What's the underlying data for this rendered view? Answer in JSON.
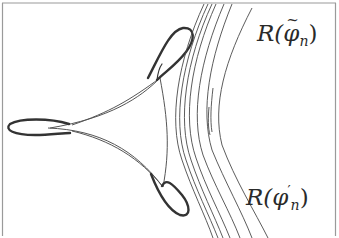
{
  "figure": {
    "colors": {
      "background": "#ffffff",
      "frame": "#9a9a9a",
      "thin_curve": "#555555",
      "thick_lobe": "#333333",
      "family_curve": "#4a4a4a",
      "label": "#2a2a2a"
    },
    "labels": {
      "top": {
        "base": "R(",
        "symbol": "φ",
        "accent": "~",
        "subscript": "n",
        "close": ")",
        "full": "R(φ̃_n)"
      },
      "bottom": {
        "base": "R(",
        "symbol": "φ",
        "prime": "′",
        "subscript": "n",
        "close": ")",
        "full": "R(φ′_n)"
      }
    },
    "components": {
      "deltoid": "thin three-cusped curve",
      "lobes": [
        "upper-right lobe",
        "left lobe",
        "lower-right lobe"
      ],
      "nested_curves_count": 9
    }
  }
}
